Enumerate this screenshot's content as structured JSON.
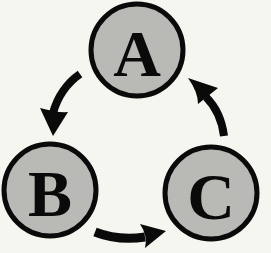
{
  "diagram": {
    "type": "cycle",
    "background_color": "#f4f6ef",
    "node_fill_color": "#b9bab6",
    "stroke_color": "#0a0a0a",
    "nodes": [
      {
        "id": "A",
        "label": "A",
        "cx": 137,
        "cy": 50,
        "r": 46
      },
      {
        "id": "B",
        "label": "B",
        "cx": 50,
        "cy": 190,
        "r": 46
      },
      {
        "id": "C",
        "label": "C",
        "cx": 211,
        "cy": 193,
        "r": 46
      }
    ],
    "edges": [
      {
        "from": "A",
        "to": "B",
        "direction": "clockwise-arrow"
      },
      {
        "from": "B",
        "to": "C",
        "direction": "clockwise-arrow"
      },
      {
        "from": "C",
        "to": "A",
        "direction": "clockwise-arrow"
      }
    ]
  }
}
